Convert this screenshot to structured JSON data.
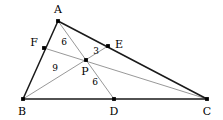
{
  "figure": {
    "kind": "geometry-diagram",
    "width": 223,
    "height": 120,
    "background_color": "#ffffff",
    "outline_color": "#1a1a1a",
    "cevian_color": "#8c8c8c",
    "point_color": "#000000",
    "text_color": "#000000"
  },
  "points": [
    {
      "id": "A",
      "label": "A",
      "x": 58,
      "y": 21,
      "label_x": 58,
      "label_y": 9,
      "on": "apex"
    },
    {
      "id": "B",
      "label": "B",
      "x": 23,
      "y": 99,
      "label_x": 22,
      "label_y": 111,
      "on": "base-left"
    },
    {
      "id": "C",
      "label": "C",
      "x": 207,
      "y": 99,
      "label_x": 207,
      "label_y": 111,
      "on": "base-right"
    },
    {
      "id": "D",
      "label": "D",
      "x": 114,
      "y": 99,
      "label_x": 114,
      "label_y": 111,
      "on": "BC"
    },
    {
      "id": "E",
      "label": "E",
      "x": 108,
      "y": 46,
      "label_x": 119,
      "label_y": 44,
      "on": "AC"
    },
    {
      "id": "F",
      "label": "F",
      "x": 44,
      "y": 48,
      "label_x": 34,
      "label_y": 42,
      "on": "AB"
    },
    {
      "id": "P",
      "label": "P",
      "x": 86,
      "y": 60,
      "label_x": 85,
      "label_y": 71,
      "on": "interior"
    }
  ],
  "sides": [
    {
      "id": "AB",
      "from": "A",
      "to": "B"
    },
    {
      "id": "AC",
      "from": "A",
      "to": "C"
    },
    {
      "id": "BC",
      "from": "B",
      "to": "C"
    }
  ],
  "cevians": [
    {
      "id": "AD",
      "from": "A",
      "to": "D",
      "through": "P"
    },
    {
      "id": "BE",
      "from": "B",
      "to": "E",
      "through": "P"
    },
    {
      "id": "CF",
      "from": "C",
      "to": "F",
      "through": "P"
    }
  ],
  "measures": [
    {
      "id": "AP",
      "segment": "AP",
      "value": "6",
      "x": 64,
      "y": 42
    },
    {
      "id": "PE",
      "segment": "PE",
      "value": "3",
      "x": 96,
      "y": 51
    },
    {
      "id": "BP",
      "segment": "BP",
      "value": "9",
      "x": 55,
      "y": 68
    },
    {
      "id": "PD",
      "segment": "PD",
      "value": "6",
      "x": 95,
      "y": 82
    }
  ]
}
